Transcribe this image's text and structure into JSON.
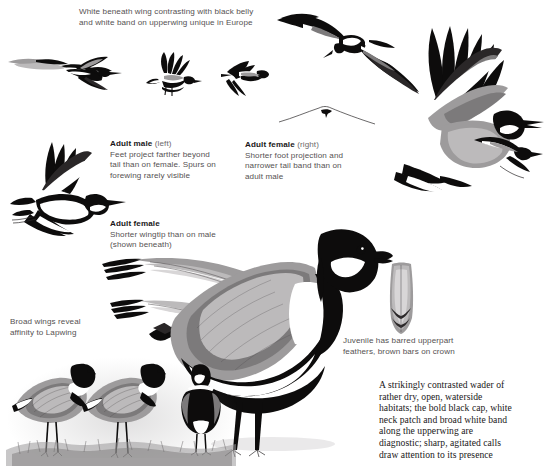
{
  "plate": {
    "subject": "Spur-winged Lapwing",
    "background_color": "#ffffff",
    "ink_color": "#0d0c0c",
    "caption_color": "#555152",
    "heading_color": "#1a1718"
  },
  "captions": {
    "upperwing": {
      "name": "upperwing-caption",
      "lines": [
        "White beneath wing contrasting with black belly",
        "and white band on upperwing unique in Europe"
      ]
    },
    "adult_male": {
      "name": "adult-male-caption",
      "heading": "Adult male",
      "heading_qualifier": "(left)",
      "lines": [
        "Feet project farther beyond",
        "tail than on female. Spurs on",
        "forewing rarely visible"
      ]
    },
    "adult_female_right": {
      "name": "adult-female-right-caption",
      "heading": "Adult female",
      "heading_qualifier": "(right)",
      "lines": [
        "Shorter foot projection and",
        "narrower tail band than on",
        "adult male"
      ]
    },
    "adult_female_wingtip": {
      "name": "adult-female-wingtip-caption",
      "heading": "Adult female",
      "heading_qualifier": "",
      "lines": [
        "Shorter wingtip than on male",
        "(shown beneath)"
      ]
    },
    "broad_wings": {
      "name": "broad-wings-caption",
      "lines": [
        "Broad wings reveal",
        "affinity to Lapwing"
      ]
    },
    "juvenile": {
      "name": "juvenile-caption",
      "lines": [
        "Juvenile has barred upperpart",
        "feathers, brown bars on crown"
      ]
    }
  },
  "blurb": {
    "name": "species-description",
    "lines": [
      "A strikingly contrasted wader of",
      "rather dry, open, waterside",
      "habitats; the bold black cap, white",
      "neck patch and broad white band",
      "along the upperwing are",
      "diagnostic; sharp, agitated calls",
      "draw attention to its presence"
    ]
  },
  "figures": [
    {
      "name": "flying-bird-upper-left-pair",
      "pose": "gliding-away",
      "view": "upperwing"
    },
    {
      "name": "flying-bird-upper-mid",
      "pose": "wings-raised",
      "view": "underwing"
    },
    {
      "name": "flying-bird-upper-right-small",
      "pose": "wings-down",
      "view": "upperwing"
    },
    {
      "name": "flying-bird-top-right",
      "pose": "wings-spread",
      "view": "underwing"
    },
    {
      "name": "flying-bird-large-right",
      "pose": "wings-up",
      "view": "upperwing"
    },
    {
      "name": "soaring-silhouette",
      "pose": "distant-glide",
      "view": "silhouette"
    },
    {
      "name": "flying-bird-left-spread",
      "pose": "wings-spread",
      "view": "upperwing"
    },
    {
      "name": "wingtip-detail-male",
      "pose": "wingtip-study",
      "view": "upperwing"
    },
    {
      "name": "wingtip-detail-female",
      "pose": "wingtip-study",
      "view": "underwing"
    },
    {
      "name": "standing-adult-main",
      "pose": "standing-profile",
      "view": "side"
    },
    {
      "name": "juvenile-feather-detail",
      "pose": "feather-study",
      "view": "detail"
    },
    {
      "name": "standing-juvenile-left",
      "pose": "standing-profile",
      "view": "side"
    },
    {
      "name": "standing-juvenile-mid",
      "pose": "standing-profile",
      "view": "side"
    },
    {
      "name": "standing-adult-frontal",
      "pose": "standing-frontal",
      "view": "front"
    },
    {
      "name": "ground-vegetation",
      "pose": "habitat-bank",
      "view": "background"
    }
  ]
}
